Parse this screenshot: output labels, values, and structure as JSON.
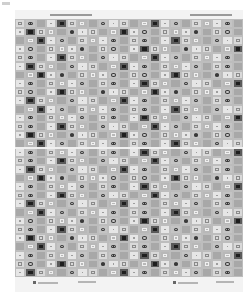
{
  "image": {
    "description": "Grayscale scan of a printed textile/wallpaper sample sheet with a repeating grid of square tile motifs",
    "background": "#ffffff",
    "sheet_color": "#f3f3f3"
  },
  "pattern": {
    "columns": 22,
    "rows": 30,
    "seam_row_y": 147,
    "tile_styles": [
      {
        "name": "light-square",
        "fill": "#d9d9d9",
        "mark": "square-outline",
        "mark_color": "#8a8a8a"
      },
      {
        "name": "mid-column",
        "fill": "#a8a8a8",
        "mark": "none",
        "mark_color": "#7a7a7a"
      },
      {
        "name": "circle-cross",
        "fill": "#c4c4c4",
        "mark": "circle-x",
        "mark_color": "#3a3a3a"
      },
      {
        "name": "dark-square",
        "fill": "#5a5a5a",
        "mark": "solid-square",
        "mark_color": "#1e1e1e"
      },
      {
        "name": "pale",
        "fill": "#e6e6e6",
        "mark": "dot",
        "mark_color": "#9d9d9d"
      },
      {
        "name": "gray",
        "fill": "#b8b8b8",
        "mark": "square-outline",
        "mark_color": "#efefef"
      }
    ]
  },
  "labels": {
    "top": [
      {
        "x": 50,
        "y": 14,
        "w": 42
      },
      {
        "x": 190,
        "y": 14,
        "w": 42
      }
    ],
    "bottom": [
      {
        "x": 38,
        "y": 282,
        "w": 20,
        "dot": true
      },
      {
        "x": 78,
        "y": 281,
        "w": 18,
        "dot": false
      },
      {
        "x": 178,
        "y": 282,
        "w": 20,
        "dot": true
      },
      {
        "x": 216,
        "y": 281,
        "w": 18,
        "dot": false
      }
    ]
  }
}
